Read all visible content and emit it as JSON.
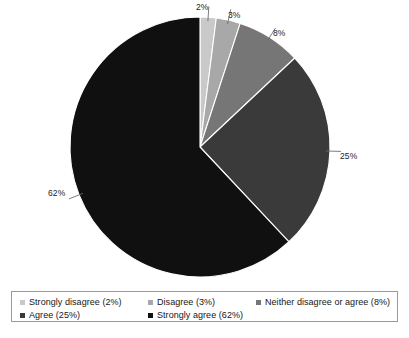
{
  "chart_data": {
    "type": "pie",
    "title": "",
    "subtitle": "",
    "xlabel": "",
    "ylabel": "",
    "grid": false,
    "legend_position": "bottom",
    "start_angle_deg": 0,
    "direction": "clockwise",
    "categories": [
      "Strongly disagree",
      "Disagree",
      "Neither disagree or agree",
      "Agree",
      "Strongly agree"
    ],
    "values": [
      2,
      3,
      8,
      25,
      62
    ],
    "value_unit": "%",
    "colors": [
      "#c9c9c9",
      "#a8a8a8",
      "#767676",
      "#3a3a3a",
      "#101010"
    ],
    "data_labels": [
      "2%",
      "3%",
      "8%",
      "25%",
      "62%"
    ],
    "legend_entries": [
      "Strongly disagree (2%)",
      "Disagree (3%)",
      "Neither disagree or agree (8%)",
      "Agree (25%)",
      "Strongly agree (62%)"
    ]
  },
  "pie": {
    "center_x": 200,
    "center_y": 147,
    "radius": 130,
    "slices": [
      {
        "label": "2%",
        "value": 2,
        "color": "#c9c9c9",
        "label_x": 196,
        "label_y": 3
      },
      {
        "label": "3%",
        "value": 3,
        "color": "#a8a8a8",
        "label_x": 228,
        "label_y": 11
      },
      {
        "label": "8%",
        "value": 8,
        "color": "#767676",
        "label_x": 273,
        "label_y": 29
      },
      {
        "label": "25%",
        "value": 25,
        "color": "#3a3a3a",
        "label_x": 340,
        "label_y": 152
      },
      {
        "label": "62%",
        "value": 62,
        "color": "#101010",
        "label_x": 48,
        "label_y": 189
      }
    ]
  },
  "legend": {
    "rows": [
      {
        "entries": [
          {
            "label": "Strongly disagree (2%)",
            "color": "#c9c9c9",
            "x": 8
          },
          {
            "label": "Disagree (3%)",
            "color": "#a8a8a8",
            "x": 136
          },
          {
            "label": "Neither disagree or agree (8%)",
            "color": "#767676",
            "x": 244
          }
        ]
      },
      {
        "entries": [
          {
            "label": "Agree (25%)",
            "color": "#3a3a3a",
            "x": 8
          },
          {
            "label": "Strongly agree (62%)",
            "color": "#101010",
            "x": 136
          }
        ]
      }
    ]
  }
}
